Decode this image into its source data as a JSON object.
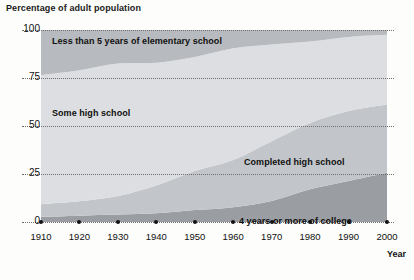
{
  "chart_data": {
    "type": "area",
    "title": "Percentage of adult population",
    "xlabel": "Year",
    "ylabel": "Percentage of adult population",
    "x": [
      1910,
      1920,
      1930,
      1940,
      1950,
      1960,
      1970,
      1980,
      1990,
      2000
    ],
    "xlim": [
      1910,
      2000
    ],
    "ylim": [
      0,
      100
    ],
    "yticks": [
      0,
      25,
      50,
      75,
      100
    ],
    "xticks": [
      1910,
      1920,
      1930,
      1940,
      1950,
      1960,
      1970,
      1980,
      1990,
      2000
    ],
    "grid": true,
    "stacked": true,
    "legend": "inline-band-labels",
    "series": [
      {
        "name": "4 years or more of college",
        "color": "#9a9da2",
        "values": [
          2.7,
          3.3,
          3.9,
          4.6,
          6.2,
          7.7,
          11.0,
          17.0,
          21.3,
          25.6
        ]
      },
      {
        "name": "Completed high school",
        "color": "#c2c5c9",
        "values": [
          6.6,
          7.5,
          9.6,
          14.4,
          20.3,
          24.6,
          31.1,
          34.6,
          36.5,
          35.6
        ]
      },
      {
        "name": "Some high school",
        "color": "#dcdee1",
        "values": [
          67.2,
          68.2,
          69.0,
          64.0,
          59.5,
          58.2,
          50.4,
          42.4,
          38.6,
          36.3
        ]
      },
      {
        "name": "Less than 5 years of elementary school",
        "color": "#b7babe",
        "values": [
          23.5,
          21.0,
          17.5,
          17.0,
          14.0,
          9.5,
          7.5,
          6.0,
          3.6,
          2.5
        ]
      }
    ]
  },
  "axes": {
    "y_tick_labels": [
      "100",
      "75",
      "50",
      "25",
      "0"
    ],
    "x_tick_labels": [
      "1910",
      "1920",
      "1930",
      "1940",
      "1950",
      "1960",
      "1970",
      "1980",
      "1990",
      "2000"
    ],
    "year_label": "Year"
  },
  "band_labels": {
    "elementary": "Less than 5 years of elementary school",
    "some_high_school": "Some high school",
    "completed_high_school": "Completed high school",
    "college": "4 years or more of college"
  },
  "colors": {
    "elementary": "#b7babe",
    "some_high_school": "#dcdee1",
    "completed_high_school": "#c2c5c9",
    "college": "#9a9da2",
    "grid": "#6e6e6e",
    "text": "#111111",
    "background": "#fdfdfb"
  }
}
